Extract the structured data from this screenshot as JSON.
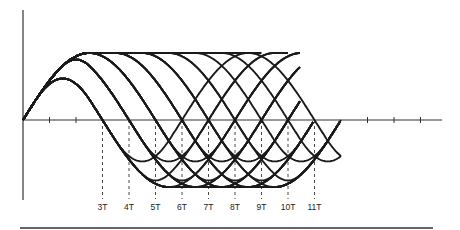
{
  "diagram": {
    "type": "eye-pattern",
    "time_unit": "T",
    "run_lengths": [
      3,
      4,
      5,
      6,
      7,
      8,
      9,
      10,
      11
    ],
    "crossing_labels": [
      "3T",
      "4T",
      "5T",
      "6T",
      "7T",
      "8T",
      "9T",
      "10T",
      "11T"
    ],
    "leading_ticks_T": [
      1,
      2
    ],
    "trailing_ticks_T": [
      13,
      14,
      15
    ],
    "edge_duration_T": 5,
    "amplitude_levels": {
      "full": 1.0,
      "3T_peak": 0.6,
      "4T_peak": 0.8
    },
    "colors": {
      "ink": "#1a1a1a",
      "background": "#ffffff"
    }
  }
}
